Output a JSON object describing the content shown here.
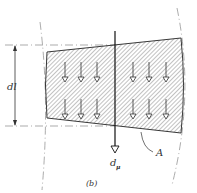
{
  "figure": {
    "caption": "(b)",
    "labels": {
      "dimension": "dl",
      "area": "A",
      "moment_main": "d",
      "moment_sub": "μ"
    },
    "arrows": {
      "columns_x": [
        65,
        81,
        97,
        133,
        149,
        166
      ],
      "row_tips_y": [
        81,
        118
      ],
      "direction": "down"
    },
    "colors": {
      "line": "#222222",
      "hatch": "#555555",
      "dashed": "#888888",
      "background": "#ffffff"
    }
  }
}
